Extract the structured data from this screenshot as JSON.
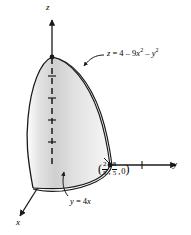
{
  "figure": {
    "name": "solid-region-3d-diagram",
    "background_color": "#ffffff",
    "stroke_color": "#1a1a1a",
    "fill_light": "#f2f2f2",
    "fill_mid": "#d9d9d9",
    "fill_dark": "#bfbfbf",
    "axes": {
      "z_label": "z",
      "y_label": "y",
      "x_label": "x"
    },
    "labels": {
      "surface_equation": {
        "lhs": "z",
        "eq": " = ",
        "const": "4",
        "minus1": " – ",
        "coef": "9",
        "var1": "x",
        "exp1": "2",
        "minus2": " – ",
        "var2": "y",
        "exp2": "2",
        "plain": "z = 4 – 9x² – y²"
      },
      "plane_equation": {
        "lhs": "y",
        "eq": " = ",
        "rhs_coef": "4",
        "rhs_var": "x",
        "plain": "y = 4x"
      },
      "point": {
        "open": "(",
        "frac1_num": "2",
        "frac1_den": "5",
        "comma1": ",",
        "frac2_num": "8",
        "frac2_den": "5",
        "comma2": ",",
        "third": "0",
        "close": ")",
        "plain": "(2/5, 8/5, 0)"
      }
    }
  }
}
